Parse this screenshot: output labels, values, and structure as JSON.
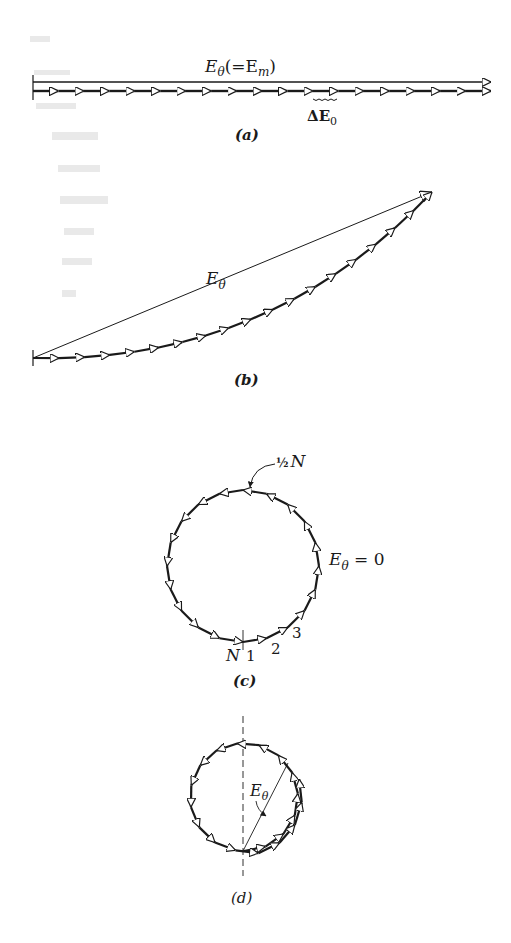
{
  "figure": {
    "colors": {
      "ink": "#1a1a1a",
      "arrow_fill": "#ffffff",
      "background": "#ffffff"
    },
    "panels": [
      {
        "id": "a",
        "caption": "(a)",
        "resultant_label": "E",
        "resultant_sub": "θ",
        "resultant_extra": "(=E",
        "resultant_extra_sub": "m",
        "resultant_close": ")",
        "element_label": "ΔE",
        "element_sub": "0",
        "arrow_count": 18,
        "description": "All phasors aligned: resultant equals maximum"
      },
      {
        "id": "b",
        "caption": "(b)",
        "resultant_label": "E",
        "resultant_sub": "θ",
        "arrow_count": 18,
        "description": "Phasors curve into an arc; resultant is the chord"
      },
      {
        "id": "c",
        "caption": "(c)",
        "half_label_frac": "½",
        "half_label_n": "N",
        "result_label": "E",
        "result_sub": "θ",
        "result_value": " = 0",
        "start_label": "N",
        "index_labels": [
          "1",
          "2",
          "3"
        ],
        "arrow_count": 20,
        "description": "Phasors close a full circle: resultant zero"
      },
      {
        "id": "d",
        "caption": "(d)",
        "resultant_label": "E",
        "resultant_sub": "θ",
        "arrow_count": 20,
        "description": "Phasors wrap beyond a full circle; resultant is a chord"
      }
    ]
  }
}
